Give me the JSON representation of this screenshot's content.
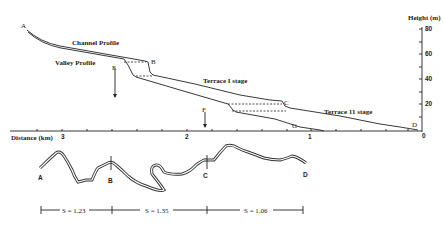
{
  "profile": {
    "y_axis_title": "Height (m)",
    "y_ticks": [
      "80",
      "60",
      "40",
      "20",
      "0"
    ],
    "x_axis_title": "Distance (km)",
    "x_ticks": [
      "3",
      "2",
      "1",
      "0"
    ],
    "labels": {
      "channel_profile": "Channel Profile",
      "valley_profile": "Valley Profile",
      "terrace_1": "Terrace I stage",
      "terrace_2": "Terrace 11 stage"
    },
    "points": {
      "A": "A",
      "B": "B",
      "C": "C",
      "D": "D",
      "E": "E",
      "F": "F",
      "G": "G"
    }
  },
  "planform": {
    "points": {
      "A": "A",
      "B": "B",
      "C": "C",
      "D": "D"
    },
    "sinuosity": [
      {
        "label": "S = 1.23"
      },
      {
        "label": "S = 1.35"
      },
      {
        "label": "S = 1.06"
      }
    ]
  }
}
